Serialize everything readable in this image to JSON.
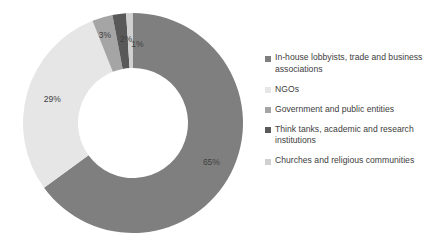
{
  "chart_data": {
    "type": "pie",
    "variant": "donut",
    "title": "",
    "subtitle": "",
    "xlabel": "",
    "ylabel": "",
    "grid": false,
    "legend_position": "right",
    "start_angle_deg": 0,
    "direction": "clockwise",
    "categories": [
      "In-house lobbyists, trade and business associations",
      "NGOs",
      "Government and public entities",
      "Think tanks, academic and research institutions",
      "Churches and religious communities"
    ],
    "values": [
      65,
      29,
      3,
      2,
      1
    ],
    "data_labels": [
      "65%",
      "29%",
      "3%",
      "2%",
      "1%"
    ],
    "unit": "%",
    "colors": [
      "#7f7f7f",
      "#e6e6e6",
      "#a5a5a5",
      "#595959",
      "#d0d0d0"
    ]
  },
  "donut": {
    "center_x": 133,
    "center_y": 123,
    "outer_radius": 110,
    "inner_radius": 55,
    "hole_fill": "#ffffff"
  },
  "legend": {
    "items": [
      {
        "label": "In-house lobbyists, trade and business associations",
        "color": "#7f7f7f"
      },
      {
        "label": "NGOs",
        "color": "#e6e6e6"
      },
      {
        "label": "Government and public entities",
        "color": "#a5a5a5"
      },
      {
        "label": "Think tanks, academic and research institutions",
        "color": "#595959"
      },
      {
        "label": "Churches and religious communities",
        "color": "#d0d0d0"
      }
    ]
  }
}
